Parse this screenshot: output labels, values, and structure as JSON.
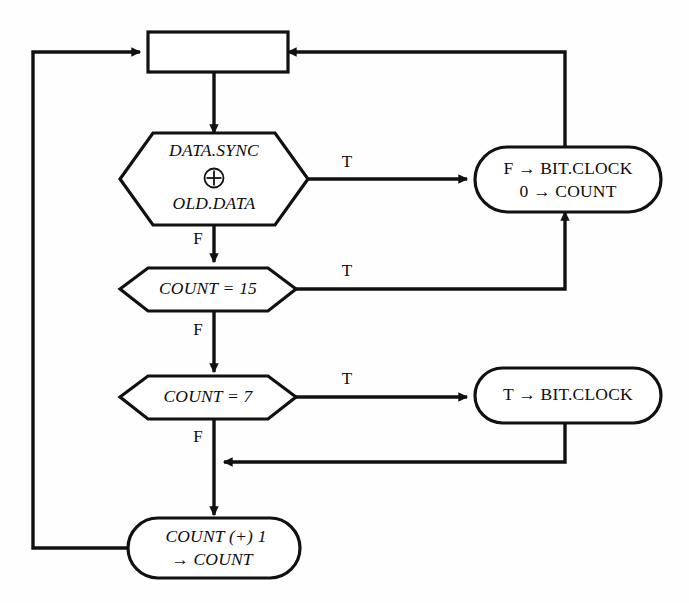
{
  "diagram": {
    "background_color": "#fefefe",
    "line_color": "#111111",
    "node_fill": "#ffffff"
  },
  "nodes": {
    "entry_box": {
      "shape": "rectangle",
      "label": ""
    },
    "decision_xor": {
      "shape": "hexagon",
      "line1": "DATA.SYNC",
      "operator": "xor-circled-plus",
      "line2": "OLD.DATA",
      "true_label": "T",
      "false_label": "F"
    },
    "decision_count_15": {
      "shape": "hexagon",
      "label": "COUNT = 15",
      "true_label": "T",
      "false_label": "F"
    },
    "decision_count_7": {
      "shape": "hexagon",
      "label": "COUNT = 7",
      "true_label": "T",
      "false_label": "F"
    },
    "action_reset": {
      "shape": "stadium",
      "line1": "F → BIT.CLOCK",
      "line2": "0 → COUNT"
    },
    "action_set_clock": {
      "shape": "stadium",
      "label": "T → BIT.CLOCK"
    },
    "action_increment": {
      "shape": "stadium",
      "line1": "COUNT (+) 1",
      "line2": "→ COUNT"
    }
  },
  "edges": [
    {
      "name": "entry-to-xor",
      "from": "entry_box",
      "to": "decision_xor",
      "label": ""
    },
    {
      "name": "xor-true-to-reset",
      "from": "decision_xor",
      "to": "action_reset",
      "label": "T"
    },
    {
      "name": "xor-false-to-count15",
      "from": "decision_xor",
      "to": "decision_count_15",
      "label": "F"
    },
    {
      "name": "count15-true-to-reset",
      "from": "decision_count_15",
      "to": "action_reset",
      "label": "T"
    },
    {
      "name": "count15-false-to-count7",
      "from": "decision_count_15",
      "to": "decision_count_7",
      "label": "F"
    },
    {
      "name": "count7-true-to-setclock",
      "from": "decision_count_7",
      "to": "action_set_clock",
      "label": "T"
    },
    {
      "name": "count7-false-to-increment",
      "from": "decision_count_7",
      "to": "action_increment",
      "label": "F"
    },
    {
      "name": "setclock-to-increment-merge",
      "from": "action_set_clock",
      "to": "action_increment",
      "label": ""
    },
    {
      "name": "reset-to-entry",
      "from": "action_reset",
      "to": "entry_box",
      "label": ""
    },
    {
      "name": "increment-to-entry",
      "from": "action_increment",
      "to": "entry_box",
      "label": ""
    }
  ]
}
